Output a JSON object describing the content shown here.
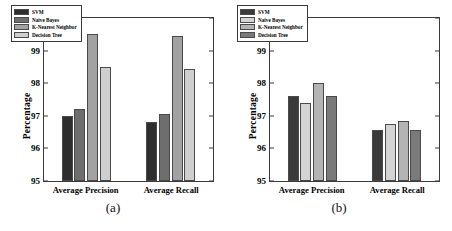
{
  "figure": {
    "panels": [
      {
        "caption": "(a)",
        "ylabel": "Percentage",
        "yticks": [
          "95",
          "96",
          "97",
          "98",
          "99",
          "100"
        ],
        "groups": [
          "Average Precision",
          "Average Recall"
        ],
        "legend": [
          {
            "label": "SVM",
            "color": "#2e2e2e"
          },
          {
            "label": "Naive Bayes",
            "color": "#6e6e6e"
          },
          {
            "label": "K-Nearest Neighbor",
            "color": "#a2a2a2"
          },
          {
            "label": "Decision Tree",
            "color": "#cfcfcf"
          }
        ]
      },
      {
        "caption": "(b)",
        "ylabel": "Percentage",
        "yticks": [
          "95",
          "96",
          "97",
          "98",
          "99",
          "100"
        ],
        "groups": [
          "Average Precision",
          "Average Recall"
        ],
        "legend": [
          {
            "label": "SVM",
            "color": "#3a3a3a"
          },
          {
            "label": "Naive Bayes",
            "color": "#d4d4d4"
          },
          {
            "label": "K-Nearest Neighbor",
            "color": "#b4b4b4"
          },
          {
            "label": "Decision Tree",
            "color": "#7a7a7a"
          }
        ]
      }
    ]
  },
  "chart_data": [
    {
      "type": "bar",
      "title": "(a)",
      "xlabel": "",
      "ylabel": "Percentage",
      "ylim": [
        95,
        100
      ],
      "yticks": [
        95,
        96,
        97,
        98,
        99,
        100
      ],
      "grid": false,
      "legend_position": "upper-left",
      "categories": [
        "Average Precision",
        "Average Recall"
      ],
      "series": [
        {
          "name": "SVM",
          "color": "#2e2e2e",
          "values": [
            97.0,
            96.8
          ]
        },
        {
          "name": "Naive Bayes",
          "color": "#6e6e6e",
          "values": [
            97.2,
            97.05
          ]
        },
        {
          "name": "K-Nearest Neighbor",
          "color": "#a2a2a2",
          "values": [
            99.5,
            99.45
          ]
        },
        {
          "name": "Decision Tree",
          "color": "#cfcfcf",
          "values": [
            98.5,
            98.45
          ]
        }
      ]
    },
    {
      "type": "bar",
      "title": "(b)",
      "xlabel": "",
      "ylabel": "Percentage",
      "ylim": [
        95,
        100
      ],
      "yticks": [
        95,
        96,
        97,
        98,
        99,
        100
      ],
      "grid": false,
      "legend_position": "upper-left",
      "categories": [
        "Average Precision",
        "Average Recall"
      ],
      "series": [
        {
          "name": "SVM",
          "color": "#3a3a3a",
          "values": [
            97.6,
            96.55
          ]
        },
        {
          "name": "Naive Bayes",
          "color": "#d4d4d4",
          "values": [
            97.4,
            96.75
          ]
        },
        {
          "name": "K-Nearest Neighbor",
          "color": "#b4b4b4",
          "values": [
            98.0,
            96.85
          ]
        },
        {
          "name": "Decision Tree",
          "color": "#7a7a7a",
          "values": [
            97.6,
            96.55
          ]
        }
      ]
    }
  ]
}
